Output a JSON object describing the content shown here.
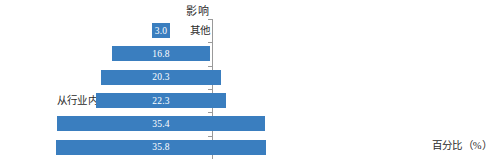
{
  "chart_data": {
    "type": "bar",
    "orientation": "horizontal",
    "style": "centered-funnel",
    "title": "",
    "ylabel": "影响",
    "xlabel": "百分比（%）",
    "categories": [
      "其他",
      "从自然教育行业转出",
      "从其他行业转入",
      "从行业内的其他机构转入现在机构",
      "没有影响",
      "同一个机构，工作职能发生改变"
    ],
    "values": [
      3.0,
      16.8,
      20.3,
      22.3,
      35.4,
      35.8
    ],
    "value_labels": [
      "3.0",
      "16.8",
      "20.3",
      "22.3",
      "35.4",
      "35.8"
    ],
    "xlim": [
      0,
      35.8
    ],
    "grid": false,
    "legend": false,
    "bar_color": "#3a7ebf",
    "value_label_color": "#ffffff",
    "axis_color": "#9a9a9a",
    "text_color": "#2b2b2b"
  }
}
